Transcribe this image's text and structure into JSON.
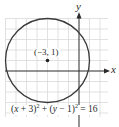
{
  "figure": {
    "type": "circle-graph",
    "center": {
      "x": -3,
      "y": 1,
      "label": "(−3, 1)"
    },
    "radius": 4,
    "equation": {
      "text": "(x + 3)² + (y − 1)² = 16",
      "part1": "(",
      "var_x": "x",
      "part2": " + 3)",
      "exp1": "2",
      "part3": " + (",
      "var_y": "y",
      "part4": " − 1)",
      "exp2": "2",
      "part5": " = 16"
    },
    "axes": {
      "x_label": "x",
      "y_label": "y"
    },
    "grid": {
      "x_range": [
        -7,
        2
      ],
      "y_range": [
        -4,
        5
      ],
      "unit": 1
    },
    "colors": {
      "grid": "#d9d9d9",
      "axis": "#2a2a2a",
      "circle": "#3a3a3a",
      "point": "#222222"
    }
  }
}
